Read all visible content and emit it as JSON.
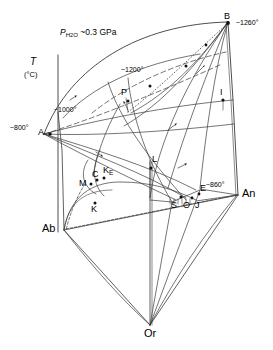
{
  "figure": {
    "kind": "ternary-phase-diagram",
    "system": "Ab-Or-An",
    "pressure_label_pre": "P",
    "pressure_label_sub": "H",
    "pressure_label_sub2": "2",
    "pressure_label_sub3": "O",
    "pressure_label_value": "~0.3 GPa",
    "pressure_label_full": "P H2O ~0.3 GPa",
    "axis_label": "T",
    "axis_unit": "(°C)"
  },
  "vertices": [
    {
      "id": "Ab",
      "label": "Ab",
      "x": 64,
      "y": 230
    },
    {
      "id": "An",
      "label": "An",
      "x": 238,
      "y": 195
    },
    {
      "id": "Or",
      "label": "Or",
      "x": 150,
      "y": 325
    }
  ],
  "points": [
    {
      "id": "A",
      "label": "A",
      "x": 44,
      "y": 134
    },
    {
      "id": "B",
      "label": "B",
      "x": 228,
      "y": 22
    },
    {
      "id": "C",
      "label": "C",
      "x": 93,
      "y": 176
    },
    {
      "id": "KE",
      "label": "K",
      "sub": "E",
      "x": 105,
      "y": 172
    },
    {
      "id": "M",
      "label": "M",
      "x": 85,
      "y": 184
    },
    {
      "id": "K",
      "label": "K",
      "x": 92,
      "y": 198
    },
    {
      "id": "L",
      "label": "L",
      "x": 150,
      "y": 162
    },
    {
      "id": "P",
      "label": "P",
      "x": 124,
      "y": 94
    },
    {
      "id": "I",
      "label": "I",
      "x": 223,
      "y": 97
    },
    {
      "id": "E",
      "label": "E",
      "x": 200,
      "y": 189
    },
    {
      "id": "S",
      "label": "S",
      "x": 175,
      "y": 201
    },
    {
      "id": "O",
      "label": "O",
      "x": 186,
      "y": 201
    },
    {
      "id": "J",
      "label": "J",
      "x": 196,
      "y": 201
    }
  ],
  "isotherms": [
    {
      "id": "t800",
      "label": "~800°",
      "x": 14,
      "y": 127
    },
    {
      "id": "t1000",
      "label": "~1000°",
      "x": 58,
      "y": 111
    },
    {
      "id": "t1200",
      "label": "~1200°",
      "x": 125,
      "y": 72
    },
    {
      "id": "t1260",
      "label": "~1260°",
      "x": 238,
      "y": 25
    },
    {
      "id": "t860",
      "label": "~860°",
      "x": 207,
      "y": 186
    }
  ],
  "colors": {
    "line": "#2b2b2b",
    "background": "#ffffff",
    "text": "#000000"
  }
}
